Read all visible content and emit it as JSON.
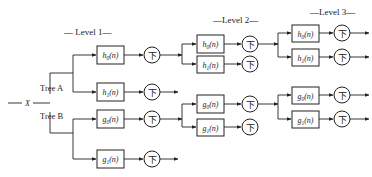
{
  "diagram": {
    "input_label": "X",
    "levels": [
      {
        "label": "— Level 1—"
      },
      {
        "label": "—Level 2—"
      },
      {
        "label": "—Level 3—"
      }
    ],
    "trees": [
      {
        "label": "Tree A"
      },
      {
        "label": "Tree B"
      }
    ],
    "downsample_symbol": "下",
    "level1": {
      "filters": [
        {
          "base": "h",
          "sub": "0",
          "arg": "(n)"
        },
        {
          "base": "h",
          "sub": "1",
          "arg": "(n)"
        },
        {
          "base": "g",
          "sub": "0",
          "arg": "(n)"
        },
        {
          "base": "g",
          "sub": "1",
          "arg": "(n)"
        }
      ]
    },
    "level2": {
      "filters": [
        {
          "base": "h",
          "sub": "0",
          "arg": "(n)"
        },
        {
          "base": "h",
          "sub": "1",
          "arg": "(n)"
        },
        {
          "base": "g",
          "sub": "0",
          "arg": "(n)"
        },
        {
          "base": "g",
          "sub": "1",
          "arg": "(n)"
        }
      ]
    },
    "level3": {
      "filters": [
        {
          "base": "h",
          "sub": "0",
          "arg": "(n)"
        },
        {
          "base": "h",
          "sub": "1",
          "arg": "(n)"
        },
        {
          "base": "g",
          "sub": "0",
          "arg": "(n)"
        },
        {
          "base": "g",
          "sub": "1",
          "arg": "(n)"
        }
      ]
    }
  }
}
